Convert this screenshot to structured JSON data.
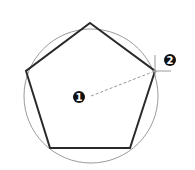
{
  "diagram": {
    "type": "inscribed-pentagon-construction",
    "circle": {
      "cx": 91,
      "cy": 96,
      "r": 67,
      "stroke": "#9a9a9a"
    },
    "pentagon": {
      "points": "90,23 155,71 130,148 50,148 26,71",
      "stroke": "#2a2a2a"
    },
    "radius_line": {
      "x1": 91,
      "y1": 96,
      "x2": 155,
      "y2": 71,
      "stroke": "#9a9a9a"
    },
    "crosshair": {
      "x": 155,
      "y": 71,
      "size": 16,
      "stroke": "#9a9a9a"
    },
    "markers": [
      {
        "label": "1",
        "cx": 79,
        "cy": 97
      },
      {
        "label": "2",
        "cx": 170,
        "cy": 60
      }
    ]
  }
}
